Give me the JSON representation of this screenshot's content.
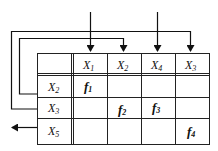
{
  "diagram": {
    "column_headers": [
      {
        "var": "X",
        "sub": "1"
      },
      {
        "var": "X",
        "sub": "2"
      },
      {
        "var": "X",
        "sub": "4"
      },
      {
        "var": "X",
        "sub": "3"
      }
    ],
    "row_headers": [
      {
        "var": "X",
        "sub": "2"
      },
      {
        "var": "X",
        "sub": "3"
      },
      {
        "var": "X",
        "sub": "5"
      }
    ],
    "cells": [
      {
        "row": 0,
        "col": 0,
        "fn": "f",
        "sub": "1"
      },
      {
        "row": 1,
        "col": 1,
        "fn": "f",
        "sub": "2"
      },
      {
        "row": 1,
        "col": 2,
        "fn": "f",
        "sub": "3"
      },
      {
        "row": 2,
        "col": 3,
        "fn": "f",
        "sub": "4"
      }
    ],
    "arrows": [
      {
        "desc": "external input into column X1"
      },
      {
        "desc": "external input into column X4"
      },
      {
        "desc": "feedback from row X2 to column X2"
      },
      {
        "desc": "feedback from row X3 to column X3"
      },
      {
        "desc": "output from row X5 to left"
      }
    ],
    "line_color": "#111111"
  }
}
